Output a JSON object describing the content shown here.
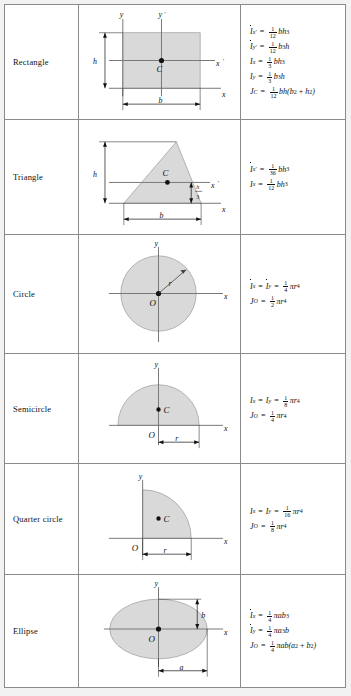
{
  "table": {
    "title": "Moments of Inertia of Plane Areas",
    "shade_color": "#d9d9d9",
    "line_color": "#8a8a8a",
    "rows": [
      {
        "id": "rectangle",
        "label": "Rectangle",
        "figure": {
          "shape": "rectangle",
          "axis_labels": [
            "y",
            "y'",
            "x'",
            "x"
          ],
          "centroid_label": "C",
          "dim_labels": [
            "h",
            "b"
          ]
        },
        "equations": [
          {
            "lhs_sym": "I",
            "lhs_bar": true,
            "lhs_sub": "x'",
            "num": "1",
            "den": "12",
            "rhs": "bh",
            "rhs_sup": "3"
          },
          {
            "lhs_sym": "I",
            "lhs_bar": true,
            "lhs_sub": "y'",
            "num": "1",
            "den": "12",
            "rhs": "b",
            "rhs_sup": "3",
            "rhs_tail": "h"
          },
          {
            "lhs_sym": "I",
            "lhs_bar": false,
            "lhs_sub": "x",
            "num": "1",
            "den": "3",
            "rhs": "bh",
            "rhs_sup": "3"
          },
          {
            "lhs_sym": "I",
            "lhs_bar": false,
            "lhs_sub": "y",
            "num": "1",
            "den": "3",
            "rhs": "b",
            "rhs_sup": "3",
            "rhs_tail": "h"
          },
          {
            "lhs_sym": "J",
            "lhs_bar": false,
            "lhs_sub": "C",
            "num": "1",
            "den": "12",
            "rhs": "bh(b",
            "rhs_sup": "2",
            "rhs_tail": " + h",
            "rhs_sup2": "2",
            "rhs_tail2": ")"
          }
        ]
      },
      {
        "id": "triangle",
        "label": "Triangle",
        "figure": {
          "shape": "triangle",
          "axis_labels": [
            "x'",
            "x"
          ],
          "centroid_label": "C",
          "dim_labels": [
            "h",
            "b"
          ],
          "frac_label": {
            "num": "h",
            "den": "3"
          }
        },
        "equations": [
          {
            "lhs_sym": "I",
            "lhs_bar": true,
            "lhs_sub": "x'",
            "num": "1",
            "den": "36",
            "rhs": "bh",
            "rhs_sup": "3"
          },
          {
            "lhs_sym": "I",
            "lhs_bar": false,
            "lhs_sub": "x",
            "num": "1",
            "den": "12",
            "rhs": "bh",
            "rhs_sup": "3"
          }
        ]
      },
      {
        "id": "circle",
        "label": "Circle",
        "figure": {
          "shape": "circle",
          "axis_labels": [
            "y",
            "x"
          ],
          "origin_label": "O",
          "dim_labels": [
            "r"
          ]
        },
        "equations": [
          {
            "lhs_sym": "I",
            "lhs_bar": true,
            "lhs_sub": "x",
            "lhs2_sym": "I",
            "lhs2_bar": true,
            "lhs2_sub": "y",
            "num": "1",
            "den": "4",
            "rhs": "πr",
            "rhs_sup": "4"
          },
          {
            "lhs_sym": "J",
            "lhs_bar": false,
            "lhs_sub": "O",
            "num": "1",
            "den": "2",
            "rhs": "πr",
            "rhs_sup": "4"
          }
        ]
      },
      {
        "id": "semicircle",
        "label": "Semicircle",
        "figure": {
          "shape": "semicircle",
          "axis_labels": [
            "y",
            "x"
          ],
          "origin_label": "O",
          "centroid_label": "C",
          "dim_labels": [
            "r"
          ]
        },
        "equations": [
          {
            "lhs_sym": "I",
            "lhs_bar": false,
            "lhs_sub": "x",
            "lhs2_sym": "I",
            "lhs2_bar": false,
            "lhs2_sub": "y",
            "num": "1",
            "den": "8",
            "rhs": "πr",
            "rhs_sup": "4"
          },
          {
            "lhs_sym": "J",
            "lhs_bar": false,
            "lhs_sub": "O",
            "num": "1",
            "den": "4",
            "rhs": "πr",
            "rhs_sup": "4"
          }
        ]
      },
      {
        "id": "quarter-circle",
        "label": "Quarter circle",
        "figure": {
          "shape": "quarter-circle",
          "axis_labels": [
            "y",
            "x"
          ],
          "origin_label": "O",
          "centroid_label": "C",
          "dim_labels": [
            "r"
          ]
        },
        "equations": [
          {
            "lhs_sym": "I",
            "lhs_bar": false,
            "lhs_sub": "x",
            "lhs2_sym": "I",
            "lhs2_bar": false,
            "lhs2_sub": "y",
            "num": "1",
            "den": "16",
            "rhs": "πr",
            "rhs_sup": "4"
          },
          {
            "lhs_sym": "J",
            "lhs_bar": false,
            "lhs_sub": "O",
            "num": "1",
            "den": "8",
            "rhs": "πr",
            "rhs_sup": "4"
          }
        ]
      },
      {
        "id": "ellipse",
        "label": "Ellipse",
        "figure": {
          "shape": "ellipse",
          "axis_labels": [
            "y",
            "x"
          ],
          "origin_label": "O",
          "dim_labels": [
            "b",
            "a"
          ]
        },
        "equations": [
          {
            "lhs_sym": "I",
            "lhs_bar": true,
            "lhs_sub": "x",
            "num": "1",
            "den": "4",
            "rhs": "πab",
            "rhs_sup": "3"
          },
          {
            "lhs_sym": "I",
            "lhs_bar": true,
            "lhs_sub": "y",
            "num": "1",
            "den": "4",
            "rhs": "πa",
            "rhs_sup": "3",
            "rhs_tail": "b"
          },
          {
            "lhs_sym": "J",
            "lhs_bar": false,
            "lhs_sub": "O",
            "num": "1",
            "den": "4",
            "rhs": "πab(a",
            "rhs_sup": "2",
            "rhs_tail": " + b",
            "rhs_sup2": "2",
            "rhs_tail2": ")"
          }
        ]
      }
    ]
  }
}
